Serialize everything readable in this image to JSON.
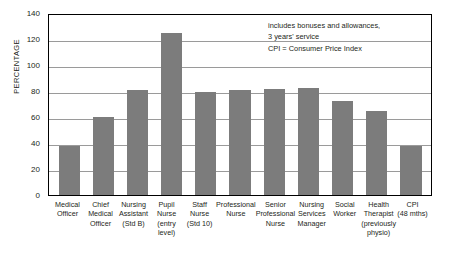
{
  "chart_data": {
    "type": "bar",
    "title": "",
    "xlabel": "",
    "ylabel": "PERCENTAGE",
    "ylim": [
      0,
      140
    ],
    "ytick_step": 20,
    "yticks": [
      140,
      120,
      100,
      80,
      60,
      40,
      20,
      0
    ],
    "grid": true,
    "legend": "none",
    "bar_color": "#7c7c7c",
    "frame_color": "#000000",
    "gridline_color": "#9a9a9a",
    "categories": [
      "Medical Officer",
      "Chief Medical Officer",
      "Nursing Assistant (Std B)",
      "Pupil Nurse (entry level)",
      "Staff Nurse (Std 10)",
      "Professional Nurse",
      "Senior Professional Nurse",
      "Nursing Services Manager",
      "Social Worker",
      "Health Therapist (previously physio)",
      "CPI (48 mths)"
    ],
    "category_lines": [
      [
        "Medical",
        "Officer"
      ],
      [
        "Chief",
        "Medical",
        "Officer"
      ],
      [
        "Nursing",
        "Assistant",
        "(Std B)"
      ],
      [
        "Pupil",
        "Nurse",
        "(entry",
        "level)"
      ],
      [
        "Staff",
        "Nurse",
        "(Std 10)"
      ],
      [
        "Professional",
        "Nurse"
      ],
      [
        "Senior",
        "Professional",
        "Nurse"
      ],
      [
        "Nursing",
        "Services",
        "Manager"
      ],
      [
        "Social",
        "Worker"
      ],
      [
        "Health",
        "Therapist",
        "(previously",
        "physio)"
      ],
      [
        "CPI",
        "(48 mths)"
      ]
    ],
    "values": [
      38,
      60,
      81,
      124.5,
      79,
      81,
      81.5,
      82,
      72,
      65,
      38
    ]
  },
  "annotation": {
    "line1": "includes bonuses and allowances,",
    "line2": "3 years' service",
    "line3": "CPI = Consumer Price Index"
  }
}
